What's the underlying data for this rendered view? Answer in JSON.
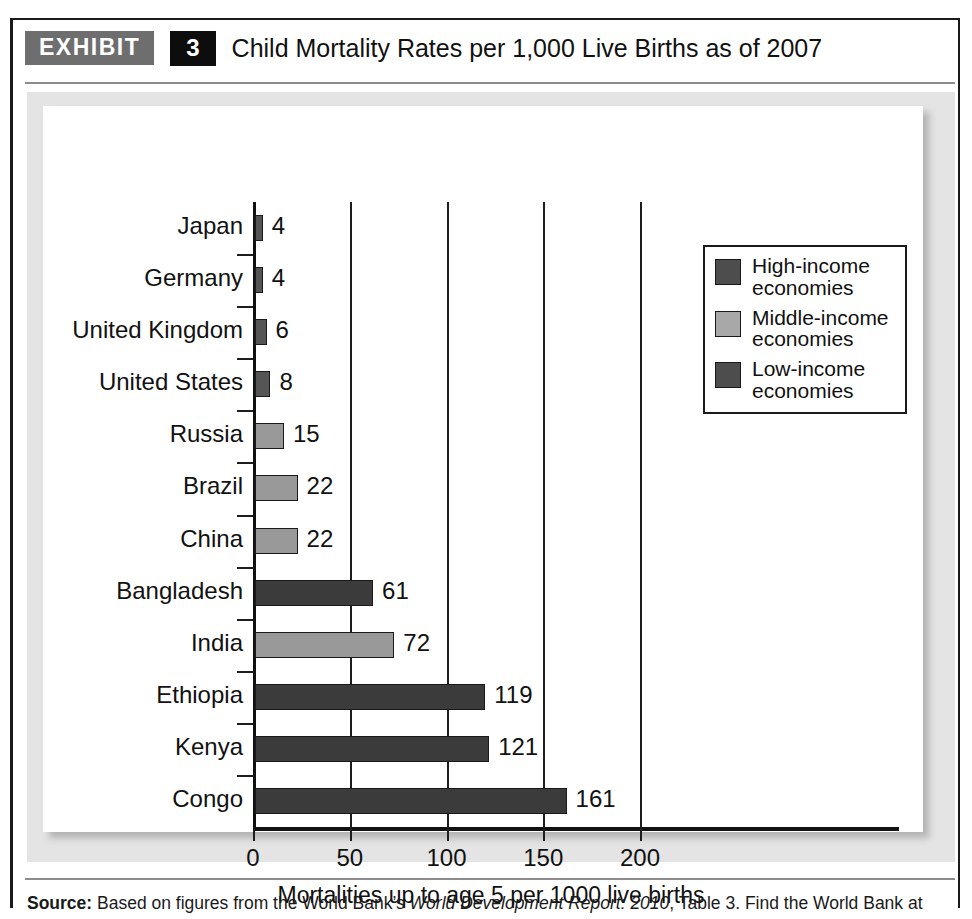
{
  "exhibit": {
    "tag": "EXHIBIT",
    "number": "3",
    "title": "Child Mortality Rates per 1,000 Live Births as of 2007"
  },
  "source": {
    "label": "Source:",
    "text_before": " Based on figures from the World Bank’s ",
    "italic": "World Development Report: 2010",
    "text_after": ", Table 3. Find the World Bank at http://www.worldbank.org."
  },
  "legend": {
    "items": [
      {
        "label": "High-income\neconomies",
        "line1": "High-income",
        "line2": "economies",
        "color": "#4d4d4d"
      },
      {
        "label": "Middle-income\neconomies",
        "line1": "Middle-income",
        "line2": "economies",
        "color": "#a8a8a8"
      },
      {
        "label": "Low-income\neconomies",
        "line1": "Low-income",
        "line2": "economies",
        "color": "#4d4d4d"
      }
    ]
  },
  "chart_data": {
    "type": "bar",
    "orientation": "horizontal",
    "title": "Child Mortality Rates per 1,000 Live Births as of 2007",
    "xlabel": "Mortalities up to age 5 per 1000 live births",
    "ylabel": "",
    "xlim": [
      0,
      215
    ],
    "xticks": [
      0,
      50,
      100,
      150,
      200
    ],
    "xtick_labels": [
      "0",
      "50",
      "100",
      "150",
      "200"
    ],
    "grid": "vertical",
    "legend_position": "upper right",
    "categories": [
      "Japan",
      "Germany",
      "United Kingdom",
      "United States",
      "Russia",
      "Brazil",
      "China",
      "Bangladesh",
      "India",
      "Ethiopia",
      "Kenya",
      "Congo"
    ],
    "values": [
      4,
      4,
      6,
      8,
      15,
      22,
      22,
      61,
      72,
      119,
      121,
      161
    ],
    "value_labels": [
      "4",
      "4",
      "6",
      "8",
      "15",
      "22",
      "22",
      "61",
      "72",
      "119",
      "121",
      "161"
    ],
    "groups": [
      "High-income",
      "High-income",
      "High-income",
      "High-income",
      "Middle-income",
      "Middle-income",
      "Middle-income",
      "Low-income",
      "Middle-income",
      "Low-income",
      "Low-income",
      "Low-income"
    ],
    "colors": {
      "High-income": "#555555",
      "Middle-income": "#999999",
      "Low-income": "#3b3b3b"
    },
    "series": [
      {
        "name": "Child mortality rate per 1,000 live births",
        "values": [
          4,
          4,
          6,
          8,
          15,
          22,
          22,
          61,
          72,
          119,
          121,
          161
        ]
      }
    ]
  },
  "theme": {
    "panel_bg": "#e4e4e4",
    "plot_bg": "#ffffff",
    "axis_color": "#111111",
    "tag_bg": "#6e6e6e",
    "number_bg": "#0d0d0d"
  }
}
